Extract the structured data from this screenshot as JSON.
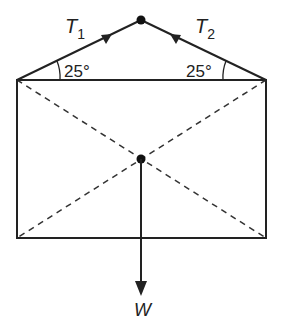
{
  "diagram": {
    "tension_left_label": "T",
    "tension_left_sub": "1",
    "tension_right_label": "T",
    "tension_right_sub": "2",
    "angle_left": "25°",
    "angle_right": "25°",
    "weight_label": "W",
    "line_color": "#222222"
  }
}
